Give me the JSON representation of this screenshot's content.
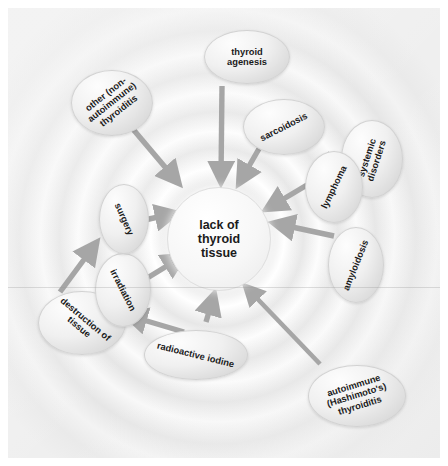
{
  "diagram": {
    "center": {
      "id": "center",
      "label": "lack of\nthyroid\ntissue"
    },
    "nodes": [
      {
        "id": "thyroid-agenesis",
        "label": "thyroid\nagenesis",
        "x": 196,
        "y": 22,
        "w": 86,
        "h": 54,
        "rot": 0
      },
      {
        "id": "other-thyroiditis",
        "label": "other (non-\nautoimmune)\nthyroiditis",
        "x": 63,
        "y": 62,
        "w": 82,
        "h": 66,
        "rot": -38
      },
      {
        "id": "sarcoidosis",
        "label": "sarcoidosis",
        "x": 235,
        "y": 91,
        "w": 82,
        "h": 56,
        "rot": -27
      },
      {
        "id": "systemic-disorders",
        "label": "systemic\ndisorders",
        "x": 333,
        "y": 112,
        "w": 62,
        "h": 78,
        "rot": -72
      },
      {
        "id": "lymphoma",
        "label": "lymphoma",
        "x": 297,
        "y": 143,
        "w": 58,
        "h": 72,
        "rot": -64
      },
      {
        "id": "amyloidosis",
        "label": "amyloidosis",
        "x": 320,
        "y": 219,
        "w": 56,
        "h": 76,
        "rot": -68
      },
      {
        "id": "autoimmune-thyroiditis",
        "label": "autoimmune\n(Hashimoto's)\nthyroiditis",
        "x": 300,
        "y": 357,
        "w": 98,
        "h": 62,
        "rot": -17
      },
      {
        "id": "radioactive-iodine",
        "label": "radioactive iodine",
        "x": 136,
        "y": 322,
        "w": 104,
        "h": 50,
        "rot": 14
      },
      {
        "id": "destruction-of-tissue",
        "label": "destruction of\ntissue",
        "x": 30,
        "y": 283,
        "w": 88,
        "h": 64,
        "rot": 40
      },
      {
        "id": "irradiation",
        "label": "irradiation",
        "x": 87,
        "y": 245,
        "w": 56,
        "h": 74,
        "rot": 63
      },
      {
        "id": "surgery",
        "label": "surgery",
        "x": 91,
        "y": 176,
        "w": 50,
        "h": 70,
        "rot": 66
      }
    ],
    "edges": [
      {
        "id": "edge-thyroid-agenesis-to-center",
        "from": "thyroid-agenesis",
        "to": "center",
        "x1": 214,
        "y1": 78,
        "x2": 213,
        "y2": 170
      },
      {
        "id": "edge-other-thyroiditis-to-center",
        "from": "other-thyroiditis",
        "to": "center",
        "x1": 124,
        "y1": 120,
        "x2": 168,
        "y2": 172
      },
      {
        "id": "edge-sarcoidosis-to-center",
        "from": "sarcoidosis",
        "to": "center",
        "x1": 252,
        "y1": 139,
        "x2": 233,
        "y2": 172
      },
      {
        "id": "edge-lymphoma-to-center",
        "from": "lymphoma",
        "to": "center",
        "x1": 297,
        "y1": 175,
        "x2": 258,
        "y2": 198
      },
      {
        "id": "edge-systemic-disorders-to-lymphoma",
        "from": "systemic-disorders",
        "to": "lymphoma",
        "x1": 332,
        "y1": 153,
        "x2": 306,
        "y2": 164
      },
      {
        "id": "edge-amyloidosis-to-center",
        "from": "amyloidosis",
        "to": "center",
        "x1": 322,
        "y1": 226,
        "x2": 268,
        "y2": 214
      },
      {
        "id": "edge-autoimmune-to-center",
        "from": "autoimmune-thyroiditis",
        "to": "center",
        "x1": 310,
        "y1": 355,
        "x2": 242,
        "y2": 280
      },
      {
        "id": "edge-radioactive-iodine-to-destruction",
        "from": "radioactive-iodine",
        "to": "destruction-of-tissue",
        "x1": 172,
        "y1": 322,
        "x2": 120,
        "y2": 306
      },
      {
        "id": "edge-irradiation-to-destruction",
        "from": "irradiation",
        "to": "destruction-of-tissue",
        "x1": 113,
        "y1": 292,
        "x2": 96,
        "y2": 304
      },
      {
        "id": "edge-destruction-to-surgery",
        "from": "destruction-of-tissue",
        "to": "surgery",
        "x1": 54,
        "y1": 283,
        "x2": 88,
        "y2": 236
      },
      {
        "id": "edge-surgery-to-center",
        "from": "surgery",
        "to": "center",
        "x1": 136,
        "y1": 211,
        "x2": 166,
        "y2": 204
      },
      {
        "id": "edge-irradiation-to-center",
        "from": "irradiation",
        "to": "center",
        "x1": 136,
        "y1": 268,
        "x2": 176,
        "y2": 246
      },
      {
        "id": "edge-destruction-to-center-lower",
        "from": "radioactive-iodine",
        "to": "center",
        "x1": 195,
        "y1": 314,
        "x2": 203,
        "y2": 288
      }
    ],
    "colors": {
      "canvas_background": "#f2f2f2",
      "page_background": "#ffffff",
      "arrow": "#a6a6a6",
      "node_fill": "#eeeeee",
      "node_border": "#d2d2d2",
      "text": "#1b1b1b",
      "ring_light": "#ffffff",
      "ring_shade": "#e6e6e6"
    }
  }
}
